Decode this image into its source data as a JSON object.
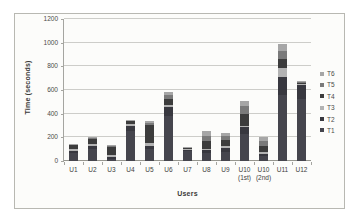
{
  "figure": {
    "type": "scanned-grayscale-excel-chart",
    "border_color": "#b8b8b2",
    "background": "#fcfcfa"
  },
  "colors": {
    "gridline": "#cdcdc9",
    "axis": "#a5a5a0",
    "tick_text": "#4a4a48",
    "title_text": "#3a3a38"
  },
  "chart_data": {
    "type": "bar",
    "stacked": true,
    "title": "",
    "xlabel": "Users",
    "ylabel": "Time (seconds)",
    "ylim": [
      0,
      1200
    ],
    "ytick_interval": 200,
    "grid": true,
    "legend_position": "right",
    "bar_width_px": 9,
    "categories": [
      "U1",
      "U2",
      "U3",
      "U4",
      "U5",
      "U6",
      "U7",
      "U8",
      "U9",
      "U10 (1st)",
      "U10 (2nd)",
      "U11",
      "U12"
    ],
    "categories_display": [
      [
        "U1"
      ],
      [
        "U2"
      ],
      [
        "U3"
      ],
      [
        "U4"
      ],
      [
        "U5"
      ],
      [
        "U6"
      ],
      [
        "U7"
      ],
      [
        "U8"
      ],
      [
        "U9"
      ],
      [
        "U10",
        "(1st)"
      ],
      [
        "U10",
        "(2nd)"
      ],
      [
        "U11"
      ],
      [
        "U12"
      ]
    ],
    "series": [
      {
        "name": "T1",
        "color": "#45454d",
        "values": [
          70,
          105,
          20,
          250,
          100,
          380,
          85,
          70,
          80,
          230,
          40,
          560,
          520
        ]
      },
      {
        "name": "T2",
        "color": "#38383f",
        "values": [
          15,
          25,
          15,
          50,
          30,
          75,
          15,
          20,
          30,
          55,
          20,
          150,
          120
        ]
      },
      {
        "name": "T3",
        "color": "#b3b3b3",
        "values": [
          15,
          15,
          20,
          15,
          25,
          20,
          5,
          15,
          15,
          15,
          20,
          80,
          10
        ]
      },
      {
        "name": "T4",
        "color": "#3c3c3c",
        "values": [
          35,
          45,
          65,
          25,
          150,
          45,
          10,
          60,
          50,
          95,
          50,
          75,
          15
        ]
      },
      {
        "name": "T5",
        "color": "#7a7a7a",
        "values": [
          5,
          5,
          5,
          5,
          20,
          35,
          3,
          50,
          40,
          70,
          40,
          65,
          5
        ]
      },
      {
        "name": "T6",
        "color": "#a6a6a6",
        "values": [
          5,
          10,
          10,
          5,
          15,
          30,
          2,
          35,
          25,
          45,
          35,
          60,
          5
        ]
      }
    ],
    "totals": [
      145,
      205,
      135,
      350,
      340,
      585,
      120,
      250,
      240,
      510,
      205,
      990,
      675
    ],
    "legend_entries": [
      "T6",
      "T5",
      "T4",
      "T3",
      "T2",
      "T1"
    ]
  }
}
